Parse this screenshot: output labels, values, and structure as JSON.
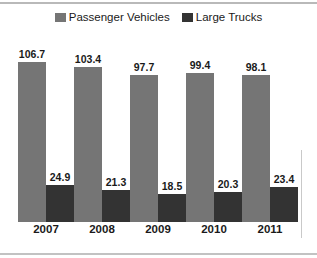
{
  "chart_data": {
    "type": "bar",
    "title": "",
    "subtitle": "",
    "xlabel": "",
    "ylabel": "",
    "categories": [
      "2007",
      "2008",
      "2009",
      "2010",
      "2011"
    ],
    "series": [
      {
        "name": "Passenger Vehicles",
        "color": "#757575",
        "values": [
          106.7,
          103.4,
          97.7,
          99.4,
          98.1
        ],
        "labels": [
          "106.7",
          "103.4",
          "97.7",
          "99.4",
          "98.1"
        ]
      },
      {
        "name": "Large Trucks",
        "color": "#333333",
        "values": [
          24.9,
          21.3,
          18.5,
          20.3,
          23.4
        ],
        "labels": [
          "24.9",
          "21.3",
          "18.5",
          "20.3",
          "23.4"
        ]
      }
    ],
    "ylim": [
      0,
      120
    ],
    "grid": false,
    "y_axis_visible": false,
    "data_labels": true,
    "legend_position": "top-center"
  },
  "legend": {
    "items": [
      {
        "label": "Passenger Vehicles",
        "color": "#757575"
      },
      {
        "label": "Large Trucks",
        "color": "#333333"
      }
    ]
  }
}
